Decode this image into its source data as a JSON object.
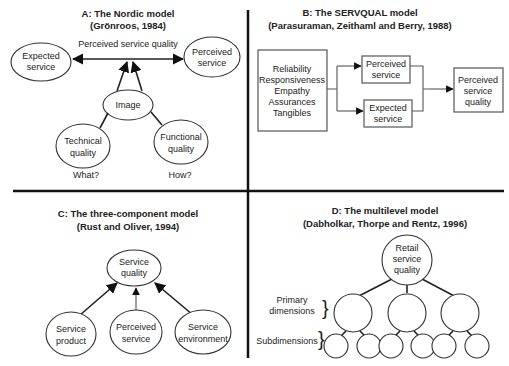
{
  "figure": {
    "dividers": {
      "vertical_x": 248,
      "horizontal_y": 191
    },
    "panels": {
      "a": {
        "title": "A: The Nordic model",
        "subtitle": "(Grönroos, 1984)",
        "arrow_label": "Perceived service quality",
        "nodes": {
          "expected": [
            "Expected",
            "service"
          ],
          "perceived": [
            "Perceived",
            "service"
          ],
          "image": "Image",
          "technical": [
            "Technical",
            "quality"
          ],
          "functional": [
            "Functional",
            "quality"
          ]
        },
        "captions": {
          "technical": "What?",
          "functional": "How?"
        }
      },
      "b": {
        "title": "B: The SERVQUAL model",
        "subtitle": "(Parasuraman, Zeithaml and Berry, 1988)",
        "dimensions": [
          "Reliability",
          "Responsiveness",
          "Empathy",
          "Assurances",
          "Tangibles"
        ],
        "nodes": {
          "perceived": [
            "Perceived",
            "service"
          ],
          "expected": [
            "Expected",
            "service"
          ],
          "quality": [
            "Perceived",
            "service",
            "quality"
          ]
        }
      },
      "c": {
        "title": "C: The three-component model",
        "subtitle": "(Rust and Oliver, 1994)",
        "nodes": {
          "quality": [
            "Service",
            "quality"
          ],
          "product": [
            "Service",
            "product"
          ],
          "perceived": [
            "Perceived",
            "service"
          ],
          "environment": [
            "Service",
            "environment"
          ]
        }
      },
      "d": {
        "title": "D: The multilevel model",
        "subtitle": "(Dabholkar, Thorpe and Rentz, 1996)",
        "root": [
          "Retail",
          "service",
          "quality"
        ],
        "levels": {
          "primary": [
            "Primary",
            "dimensions"
          ],
          "sub": "Subdimensions"
        },
        "brace": "}"
      }
    }
  }
}
